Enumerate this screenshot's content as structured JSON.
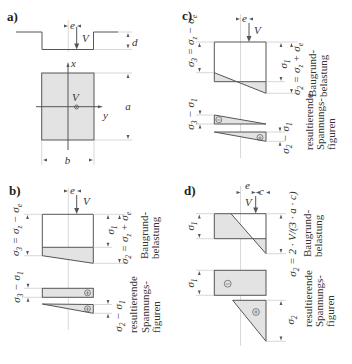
{
  "colors": {
    "line": "#555555",
    "fill": "#e3e3e3",
    "guide": "#c9c9c9",
    "text": "#333333"
  },
  "panels": {
    "a": {
      "label": "a)",
      "ecc_label": "e",
      "force_label": "V",
      "depth_label": "d",
      "axis_x_label": "x",
      "axis_y_label": "y",
      "load_point_label": "V",
      "length_label": "a",
      "width_label": "b"
    },
    "b": {
      "label": "b)",
      "ecc_label": "e",
      "force_label": "V",
      "sigma3_eq": "σ_3 = σ_z − σ_e",
      "sigma1": "σ_1",
      "sigma2_eq": "σ_2 = σ_z + σ_e",
      "load_caption": [
        "Baugrund-",
        "belastung"
      ],
      "result_top_dim": "σ_3 − σ_1",
      "result_bottom_dim": "σ_2 − σ_1",
      "result_top_sign": "+",
      "result_bottom_sign": "+",
      "result_caption": [
        "resultierende",
        "Spannungs-",
        "figuren"
      ]
    },
    "c": {
      "label": "c)",
      "ecc_label": "e",
      "force_label": "V",
      "sigma3_eq": "σ_3 = σ_z − σ_e",
      "sigma1": "σ_1",
      "sigma2_eq": "σ_2 = σ_z + σ_e",
      "load_caption": [
        "Baugrund-",
        "belastung"
      ],
      "result_top_dim": "σ_3 − σ_1",
      "result_bottom_dim": "σ_2 − σ_1",
      "result_top_sign": "−",
      "result_bottom_sign": "+",
      "result_caption": [
        "resultierende",
        "Spannungs-",
        "figuren"
      ]
    },
    "d": {
      "label": "d)",
      "ecc_label": "e",
      "edge_label": "c",
      "force_label": "V",
      "sigma1": "σ_1",
      "sigma2_eq": "σ_2 = 2 · V/(3 · a · c)",
      "load_caption": [
        "Baugrund-",
        "belastung"
      ],
      "result_top_dim": "σ_1",
      "result_bottom_dim": "σ_2",
      "result_top_sign": "−",
      "result_bottom_sign": "+",
      "result_caption": [
        "resultierende",
        "Spannungs-",
        "figuren"
      ]
    }
  }
}
